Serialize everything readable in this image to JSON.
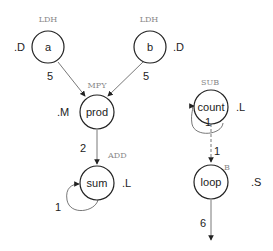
{
  "nodes": {
    "a": {
      "label": "a",
      "op": "LDH",
      "unit": ".D"
    },
    "b": {
      "label": "b",
      "op": "LDH",
      "unit": ".D"
    },
    "prod": {
      "label": "prod",
      "op": "MPY",
      "unit": ".M"
    },
    "sum": {
      "label": "sum",
      "op": "ADD",
      "unit": ".L"
    },
    "count": {
      "label": "count",
      "op": "SUB",
      "unit": ".L"
    },
    "loop": {
      "label": "loop",
      "op": "B",
      "unit": ".S"
    }
  },
  "edges": {
    "a_prod": "5",
    "b_prod": "5",
    "prod_sum": "2",
    "sum_self": "1",
    "count_self": "1",
    "count_loop": "1",
    "loop_out": "6"
  }
}
